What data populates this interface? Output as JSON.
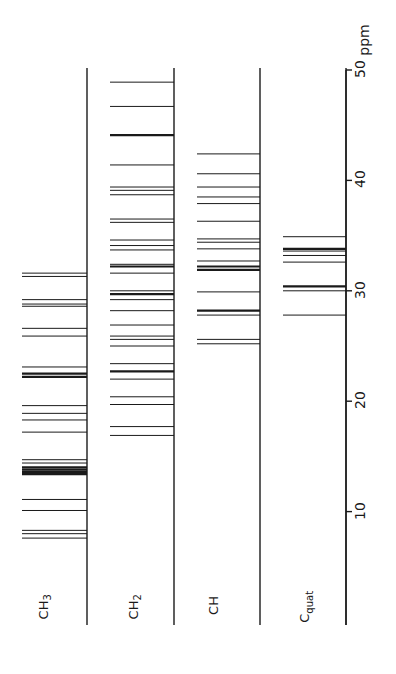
{
  "chart_data": {
    "type": "bar",
    "subtype": "stick-spectrum",
    "orientation": "rotated-90-ccw",
    "title": "",
    "xlabel": "ppm",
    "ylabel": "",
    "xlim": [
      0,
      50
    ],
    "x_ticks": [
      10,
      20,
      30,
      40,
      50
    ],
    "x_tick_labels": [
      "10",
      "20",
      "30",
      "40",
      "50"
    ],
    "axis_unit_label": "ppm",
    "grid": false,
    "legend": null,
    "series": [
      {
        "name": "CH3",
        "label_main": "CH",
        "label_sub": "3",
        "values": [
          31.6,
          31.3,
          29.2,
          28.8,
          28.6,
          26.6,
          25.9,
          23.1,
          22.5,
          22.2,
          19.6,
          18.9,
          18.3,
          17.2,
          14.7,
          14.4,
          14.0,
          13.8,
          13.6,
          13.4,
          11.1,
          10.1,
          8.3,
          8.0,
          7.6
        ]
      },
      {
        "name": "CH2",
        "label_main": "CH",
        "label_sub": "2",
        "values": [
          48.9,
          46.7,
          44.1,
          41.4,
          39.4,
          39.1,
          38.7,
          36.5,
          36.2,
          34.6,
          34.1,
          33.7,
          32.4,
          32.2,
          31.6,
          30.0,
          29.7,
          29.2,
          28.2,
          26.9,
          25.9,
          25.6,
          25.0,
          23.4,
          22.7,
          22.0,
          20.4,
          19.7,
          17.7,
          16.9
        ]
      },
      {
        "name": "CH",
        "label_main": "CH",
        "label_sub": "",
        "values": [
          42.4,
          40.6,
          39.4,
          38.5,
          37.9,
          36.3,
          34.7,
          34.4,
          33.8,
          32.7,
          32.2,
          31.9,
          29.9,
          28.2,
          27.8,
          25.6,
          25.2
        ]
      },
      {
        "name": "Cquat",
        "label_main": "C",
        "label_sub": "quat",
        "values": [
          34.9,
          33.8,
          33.6,
          33.2,
          32.6,
          30.4,
          30.0,
          27.8
        ]
      }
    ],
    "bold_lines": {
      "CH3": [
        22.5,
        22.2,
        14.0,
        13.8,
        13.6,
        13.4
      ],
      "CH2": [
        44.1,
        32.2,
        29.7,
        22.7
      ],
      "CH": [
        32.2,
        31.9,
        28.2
      ],
      "Cquat": [
        33.8,
        30.4
      ]
    }
  },
  "colors": {
    "ink": "#1a1a1a",
    "background": "#ffffff"
  }
}
